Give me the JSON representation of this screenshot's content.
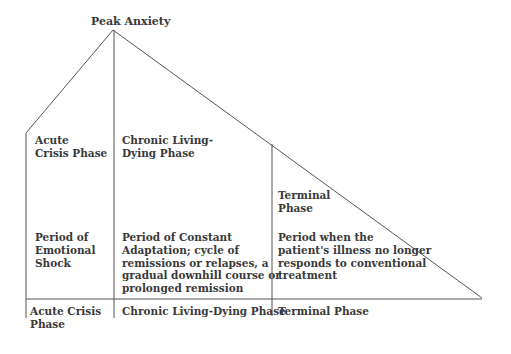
{
  "diagram": {
    "peak_label": "Peak Anxiety",
    "phases": [
      {
        "name": "Acute\nCrisis Phase",
        "description": "Period of\nEmotional\nShock",
        "axis_label": "Acute Crisis\nPhase"
      },
      {
        "name": "Chronic Living-\nDying Phase",
        "description": "Period of Constant\nAdaptation; cycle of\nremissions or relapses, a\ngradual downhill course or\nprolonged remission",
        "axis_label": "Chronic Living-Dying Phase"
      },
      {
        "name": "Terminal\nPhase",
        "description": "Period when the\npatient's illness no longer\nresponds to conventional\ntreatment",
        "axis_label": "Terminal Phase"
      }
    ],
    "line_color": "#555555"
  }
}
